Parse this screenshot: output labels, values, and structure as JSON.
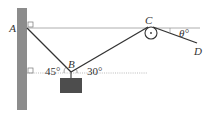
{
  "diagram": {
    "type": "statics-rope-pulley",
    "points": {
      "A": {
        "label": "A"
      },
      "B": {
        "label": "B"
      },
      "C": {
        "label": "C"
      },
      "D": {
        "label": "D"
      }
    },
    "angles": {
      "left": "45°",
      "right": "30°",
      "theta": "θ°"
    },
    "colors": {
      "wall": "#8c8c8c",
      "block": "#4d4d4d",
      "rope": "#333333",
      "reference_line": "#9a9a9a"
    }
  }
}
